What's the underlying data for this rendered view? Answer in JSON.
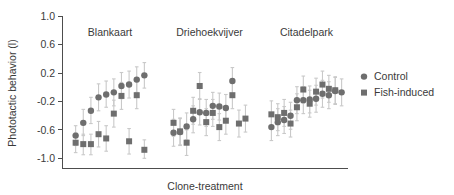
{
  "chart_data": {
    "type": "scatter",
    "title": "",
    "xlabel": "Clone-treatment",
    "ylabel": "Phototactic behavior (l)",
    "ylim": [
      -1.0,
      1.0
    ],
    "yticks": [
      1.0,
      0.6,
      0.2,
      -0.2,
      -0.6,
      -1.0
    ],
    "ytick_labels": [
      "1.0",
      "0.6",
      "0.2",
      "-0.2",
      "-0.6",
      "-1.0"
    ],
    "xticks": [],
    "xtick_labels": [],
    "grid": false,
    "legend_position": "right",
    "error_bars": "95% confidence interval",
    "panels": [
      "Blankaart",
      "Driehoekvijver",
      "Citadelpark"
    ],
    "series": [
      {
        "name": "Control",
        "marker": "circle",
        "color": "#6e6e6e",
        "points": [
          {
            "panel": "Blankaart",
            "x": 1,
            "y": -0.68,
            "lo": -0.82,
            "hi": -0.54
          },
          {
            "panel": "Blankaart",
            "x": 2,
            "y": -0.5,
            "lo": -0.68,
            "hi": -0.31
          },
          {
            "panel": "Blankaart",
            "x": 3,
            "y": -0.33,
            "lo": -0.51,
            "hi": -0.14
          },
          {
            "panel": "Blankaart",
            "x": 4,
            "y": -0.14,
            "lo": -0.33,
            "hi": 0.05
          },
          {
            "panel": "Blankaart",
            "x": 5,
            "y": -0.1,
            "lo": -0.28,
            "hi": 0.09
          },
          {
            "panel": "Blankaart",
            "x": 6,
            "y": -0.07,
            "lo": -0.26,
            "hi": 0.12
          },
          {
            "panel": "Blankaart",
            "x": 7,
            "y": 0.02,
            "lo": -0.16,
            "hi": 0.21
          },
          {
            "panel": "Blankaart",
            "x": 8,
            "y": 0.04,
            "lo": -0.15,
            "hi": 0.23
          },
          {
            "panel": "Blankaart",
            "x": 9,
            "y": 0.11,
            "lo": -0.07,
            "hi": 0.29
          },
          {
            "panel": "Blankaart",
            "x": 10,
            "y": 0.17,
            "lo": -0.01,
            "hi": 0.35
          },
          {
            "panel": "Driehoekvijver",
            "x": 1,
            "y": -0.64,
            "lo": -0.83,
            "hi": -0.45
          },
          {
            "panel": "Driehoekvijver",
            "x": 2,
            "y": -0.63,
            "lo": -0.82,
            "hi": -0.44
          },
          {
            "panel": "Driehoekvijver",
            "x": 3,
            "y": -0.55,
            "lo": -0.74,
            "hi": -0.36
          },
          {
            "panel": "Driehoekvijver",
            "x": 4,
            "y": -0.45,
            "lo": -0.64,
            "hi": -0.26
          },
          {
            "panel": "Driehoekvijver",
            "x": 5,
            "y": -0.35,
            "lo": -0.53,
            "hi": -0.16
          },
          {
            "panel": "Driehoekvijver",
            "x": 6,
            "y": -0.36,
            "lo": -0.55,
            "hi": -0.17
          },
          {
            "panel": "Driehoekvijver",
            "x": 7,
            "y": -0.26,
            "lo": -0.45,
            "hi": -0.07
          },
          {
            "panel": "Driehoekvijver",
            "x": 8,
            "y": -0.27,
            "lo": -0.46,
            "hi": -0.08
          },
          {
            "panel": "Driehoekvijver",
            "x": 9,
            "y": -0.29,
            "lo": -0.48,
            "hi": -0.1
          },
          {
            "panel": "Driehoekvijver",
            "x": 10,
            "y": 0.09,
            "lo": -0.1,
            "hi": 0.28
          },
          {
            "panel": "Citadelpark",
            "x": 1,
            "y": -0.56,
            "lo": -0.75,
            "hi": -0.37
          },
          {
            "panel": "Citadelpark",
            "x": 2,
            "y": -0.49,
            "lo": -0.68,
            "hi": -0.3
          },
          {
            "panel": "Citadelpark",
            "x": 3,
            "y": -0.46,
            "lo": -0.65,
            "hi": -0.27
          },
          {
            "panel": "Citadelpark",
            "x": 4,
            "y": -0.4,
            "lo": -0.59,
            "hi": -0.21
          },
          {
            "panel": "Citadelpark",
            "x": 5,
            "y": -0.18,
            "lo": -0.37,
            "hi": 0.01
          },
          {
            "panel": "Citadelpark",
            "x": 6,
            "y": -0.18,
            "lo": -0.37,
            "hi": 0.01
          },
          {
            "panel": "Citadelpark",
            "x": 7,
            "y": -0.17,
            "lo": -0.36,
            "hi": 0.02
          },
          {
            "panel": "Citadelpark",
            "x": 8,
            "y": -0.16,
            "lo": -0.35,
            "hi": 0.03
          },
          {
            "panel": "Citadelpark",
            "x": 9,
            "y": -0.09,
            "lo": -0.28,
            "hi": 0.1
          },
          {
            "panel": "Citadelpark",
            "x": 10,
            "y": -0.11,
            "lo": -0.3,
            "hi": 0.08
          },
          {
            "panel": "Citadelpark",
            "x": 11,
            "y": -0.05,
            "lo": -0.24,
            "hi": 0.14
          },
          {
            "panel": "Citadelpark",
            "x": 12,
            "y": -0.07,
            "lo": -0.26,
            "hi": 0.12
          }
        ]
      },
      {
        "name": "Fish-induced",
        "marker": "square",
        "color": "#6e6e6e",
        "points": [
          {
            "panel": "Blankaart",
            "x": 1,
            "y": -0.78,
            "lo": -0.92,
            "hi": -0.64
          },
          {
            "panel": "Blankaart",
            "x": 2,
            "y": -0.8,
            "lo": -0.95,
            "hi": -0.66
          },
          {
            "panel": "Blankaart",
            "x": 3,
            "y": -0.8,
            "lo": -0.95,
            "hi": -0.66
          },
          {
            "panel": "Blankaart",
            "x": 4,
            "y": -0.66,
            "lo": -0.84,
            "hi": -0.48
          },
          {
            "panel": "Blankaart",
            "x": 5,
            "y": -0.72,
            "lo": -0.9,
            "hi": -0.54
          },
          {
            "panel": "Blankaart",
            "x": 6,
            "y": -0.37,
            "lo": -0.56,
            "hi": -0.18
          },
          {
            "panel": "Blankaart",
            "x": 7,
            "y": -0.12,
            "lo": -0.31,
            "hi": 0.07
          },
          {
            "panel": "Blankaart",
            "x": 8,
            "y": -0.76,
            "lo": -0.94,
            "hi": -0.58
          },
          {
            "panel": "Blankaart",
            "x": 9,
            "y": -0.11,
            "lo": -0.3,
            "hi": 0.08
          },
          {
            "panel": "Blankaart",
            "x": 10,
            "y": -0.88,
            "lo": -1.0,
            "hi": -0.74
          },
          {
            "panel": "Driehoekvijver",
            "x": 1,
            "y": -0.5,
            "lo": -0.69,
            "hi": -0.31
          },
          {
            "panel": "Driehoekvijver",
            "x": 2,
            "y": -0.62,
            "lo": -0.81,
            "hi": -0.43
          },
          {
            "panel": "Driehoekvijver",
            "x": 3,
            "y": -0.78,
            "lo": -0.96,
            "hi": -0.6
          },
          {
            "panel": "Driehoekvijver",
            "x": 4,
            "y": -0.33,
            "lo": -0.52,
            "hi": -0.14
          },
          {
            "panel": "Driehoekvijver",
            "x": 5,
            "y": 0.02,
            "lo": -0.17,
            "hi": 0.21
          },
          {
            "panel": "Driehoekvijver",
            "x": 6,
            "y": -0.49,
            "lo": -0.68,
            "hi": -0.3
          },
          {
            "panel": "Driehoekvijver",
            "x": 7,
            "y": -0.36,
            "lo": -0.55,
            "hi": -0.17
          },
          {
            "panel": "Driehoekvijver",
            "x": 8,
            "y": -0.56,
            "lo": -0.75,
            "hi": -0.37
          },
          {
            "panel": "Driehoekvijver",
            "x": 9,
            "y": -0.47,
            "lo": -0.66,
            "hi": -0.28
          },
          {
            "panel": "Driehoekvijver",
            "x": 10,
            "y": -0.11,
            "lo": -0.3,
            "hi": 0.08
          },
          {
            "panel": "Driehoekvijver",
            "x": 11,
            "y": -0.51,
            "lo": -0.7,
            "hi": -0.32
          },
          {
            "panel": "Driehoekvijver",
            "x": 12,
            "y": -0.44,
            "lo": -0.63,
            "hi": -0.25
          },
          {
            "panel": "Citadelpark",
            "x": 1,
            "y": -0.38,
            "lo": -0.57,
            "hi": -0.19
          },
          {
            "panel": "Citadelpark",
            "x": 2,
            "y": -0.42,
            "lo": -0.61,
            "hi": -0.23
          },
          {
            "panel": "Citadelpark",
            "x": 3,
            "y": -0.36,
            "lo": -0.55,
            "hi": -0.17
          },
          {
            "panel": "Citadelpark",
            "x": 4,
            "y": -0.51,
            "lo": -0.7,
            "hi": -0.32
          },
          {
            "panel": "Citadelpark",
            "x": 5,
            "y": -0.28,
            "lo": -0.47,
            "hi": -0.09
          },
          {
            "panel": "Citadelpark",
            "x": 6,
            "y": -0.03,
            "lo": -0.22,
            "hi": 0.16
          },
          {
            "panel": "Citadelpark",
            "x": 7,
            "y": -0.23,
            "lo": -0.42,
            "hi": -0.04
          },
          {
            "panel": "Citadelpark",
            "x": 8,
            "y": -0.06,
            "lo": -0.25,
            "hi": 0.13
          },
          {
            "panel": "Citadelpark",
            "x": 9,
            "y": 0.04,
            "lo": -0.15,
            "hi": 0.23
          },
          {
            "panel": "Citadelpark",
            "x": 10,
            "y": -0.02,
            "lo": -0.21,
            "hi": 0.17
          },
          {
            "panel": "Citadelpark",
            "x": 11,
            "y": -0.04,
            "lo": -0.23,
            "hi": 0.15
          }
        ]
      }
    ],
    "legend": [
      {
        "label": "Control",
        "marker": "circle",
        "color": "#6e6e6e"
      },
      {
        "label": "Fish-induced",
        "marker": "square",
        "color": "#6e6e6e"
      }
    ]
  },
  "colors": {
    "marker": "#6e6e6e",
    "error_bar": "#c9c9c9",
    "axis": "#4d4d4d",
    "text": "#3a3a3a",
    "background": "#ffffff"
  }
}
